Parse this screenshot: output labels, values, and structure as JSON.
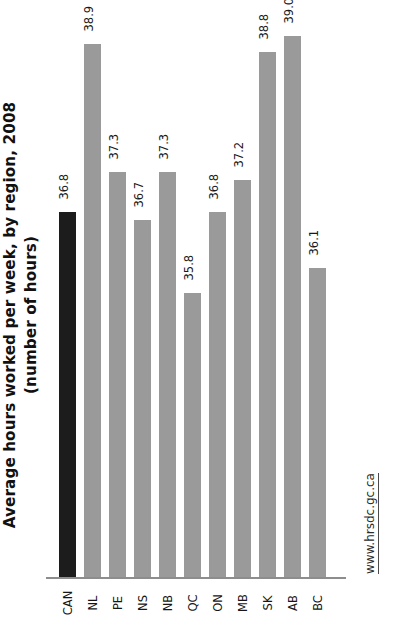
{
  "chart_data": {
    "type": "bar",
    "title": "Average hours worked per week, by region, 2008",
    "subtitle": "(number of hours)",
    "xlabel": "",
    "ylabel": "",
    "categories": [
      "CAN",
      "NL",
      "PE",
      "NS",
      "NB",
      "QC",
      "ON",
      "MB",
      "SK",
      "AB",
      "BC"
    ],
    "values": [
      36.8,
      38.9,
      37.3,
      36.7,
      37.3,
      35.8,
      36.8,
      37.2,
      38.8,
      39.0,
      36.1
    ],
    "value_labels": [
      "36.8",
      "38.9",
      "37.3",
      "36.7",
      "37.3",
      "35.8",
      "36.8",
      "37.2",
      "38.8",
      "39.0",
      "36.1"
    ],
    "highlight_category": "CAN",
    "ylim": [
      32.25,
      39.35
    ],
    "grid": false,
    "legend": false,
    "bar_color": "#9a9a9a",
    "highlight_color": "#1c1c1c",
    "axis_color": "#8d8d8d",
    "orientation": "vertical-rotated-90ccw"
  },
  "source": {
    "label": "www.hrsdc.gc.ca"
  }
}
